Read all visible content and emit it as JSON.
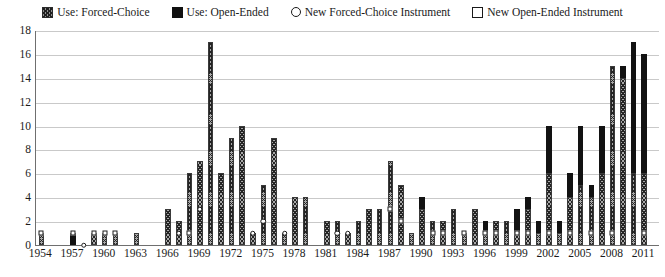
{
  "chart_data": {
    "type": "bar",
    "title": "",
    "subtitle": "",
    "xlabel": "",
    "ylabel": "",
    "ylim": [
      0,
      18
    ],
    "ytick_step": 2,
    "yticks": [
      0,
      2,
      4,
      6,
      8,
      10,
      12,
      14,
      16,
      18
    ],
    "grid": true,
    "stacked": true,
    "legend_position": "top-center",
    "legend": [
      {
        "label": "Use: Forced-Choice",
        "swatch": "hatched-square",
        "color": "#8d8d8d"
      },
      {
        "label": "Use: Open-Ended",
        "swatch": "filled-square",
        "color": "#111111"
      },
      {
        "label": "New Forced-Choice Instrument",
        "swatch": "open-circle",
        "color": "#ffffff"
      },
      {
        "label": "New Open-Ended Instrument",
        "swatch": "open-square",
        "color": "#ffffff"
      }
    ],
    "xtick_labels": [
      "1954",
      "1957",
      "1960",
      "1963",
      "1966",
      "1969",
      "1972",
      "1975",
      "1978",
      "1981",
      "1984",
      "1987",
      "1990",
      "1993",
      "1996",
      "1999",
      "2002",
      "2005",
      "2008",
      "2011"
    ],
    "xtick_interval_years": 3,
    "x_range": [
      1954,
      2012
    ],
    "categories": [
      1954,
      1955,
      1956,
      1957,
      1958,
      1959,
      1960,
      1961,
      1962,
      1963,
      1964,
      1965,
      1966,
      1967,
      1968,
      1969,
      1970,
      1971,
      1972,
      1973,
      1974,
      1975,
      1976,
      1977,
      1978,
      1979,
      1980,
      1981,
      1982,
      1983,
      1984,
      1985,
      1986,
      1987,
      1988,
      1989,
      1990,
      1991,
      1992,
      1993,
      1994,
      1995,
      1996,
      1997,
      1998,
      1999,
      2000,
      2001,
      2002,
      2003,
      2004,
      2005,
      2006,
      2007,
      2008,
      2009,
      2010,
      2011,
      2012
    ],
    "series": [
      {
        "name": "Use: Forced-Choice",
        "values": [
          1,
          0,
          0,
          0,
          0,
          1,
          1,
          1,
          0,
          1,
          0,
          0,
          3,
          2,
          6,
          7,
          17,
          6,
          9,
          10,
          1,
          5,
          9,
          1,
          4,
          4,
          0,
          2,
          2,
          1,
          2,
          3,
          3,
          7,
          5,
          1,
          3,
          2,
          2,
          3,
          1,
          3,
          1,
          2,
          2,
          1,
          3,
          1,
          6,
          1,
          4,
          5,
          4,
          6,
          15,
          14,
          6,
          6,
          0
        ]
      },
      {
        "name": "Use: Open-Ended",
        "values": [
          0,
          0,
          0,
          1,
          0,
          0,
          0,
          0,
          0,
          0,
          0,
          0,
          0,
          0,
          0,
          0,
          0,
          0,
          0,
          0,
          0,
          0,
          0,
          0,
          0,
          0,
          0,
          0,
          0,
          0,
          0,
          0,
          0,
          0,
          0,
          0,
          1,
          0,
          0,
          0,
          0,
          0,
          1,
          0,
          0,
          2,
          1,
          1,
          4,
          1,
          2,
          5,
          1,
          4,
          0,
          1,
          11,
          10,
          0
        ]
      }
    ],
    "markers": [
      {
        "year": 1954,
        "type": "New Open-Ended Instrument",
        "shape": "square",
        "value": 1
      },
      {
        "year": 1957,
        "type": "New Open-Ended Instrument",
        "shape": "square",
        "value": 1
      },
      {
        "year": 1958,
        "type": "New Forced-Choice Instrument",
        "shape": "circle",
        "value": 0
      },
      {
        "year": 1959,
        "type": "New Open-Ended Instrument",
        "shape": "square",
        "value": 1
      },
      {
        "year": 1960,
        "type": "New Open-Ended Instrument",
        "shape": "square",
        "value": 1
      },
      {
        "year": 1961,
        "type": "New Open-Ended Instrument",
        "shape": "square",
        "value": 1
      },
      {
        "year": 1967,
        "type": "New Forced-Choice Instrument",
        "shape": "circle",
        "value": 1
      },
      {
        "year": 1968,
        "type": "New Open-Ended Instrument",
        "shape": "square",
        "value": 1
      },
      {
        "year": 1969,
        "type": "New Forced-Choice Instrument",
        "shape": "circle",
        "value": 3
      },
      {
        "year": 1974,
        "type": "New Forced-Choice Instrument",
        "shape": "circle",
        "value": 1
      },
      {
        "year": 1975,
        "type": "New Forced-Choice Instrument",
        "shape": "circle",
        "value": 2
      },
      {
        "year": 1977,
        "type": "New Forced-Choice Instrument",
        "shape": "circle",
        "value": 1
      },
      {
        "year": 1982,
        "type": "New Forced-Choice Instrument",
        "shape": "circle",
        "value": 1
      },
      {
        "year": 1983,
        "type": "New Forced-Choice Instrument",
        "shape": "circle",
        "value": 1
      },
      {
        "year": 1987,
        "type": "New Open-Ended Instrument",
        "shape": "square",
        "value": 3
      },
      {
        "year": 1988,
        "type": "New Open-Ended Instrument",
        "shape": "square",
        "value": 2
      },
      {
        "year": 1991,
        "type": "New Open-Ended Instrument",
        "shape": "square",
        "value": 1
      },
      {
        "year": 1992,
        "type": "New Open-Ended Instrument",
        "shape": "square",
        "value": 1
      },
      {
        "year": 1994,
        "type": "New Open-Ended Instrument",
        "shape": "square",
        "value": 1
      },
      {
        "year": 1996,
        "type": "New Open-Ended Instrument",
        "shape": "square",
        "value": 1
      },
      {
        "year": 1997,
        "type": "New Open-Ended Instrument",
        "shape": "square",
        "value": 1
      },
      {
        "year": 1999,
        "type": "New Open-Ended Instrument",
        "shape": "square",
        "value": 1
      },
      {
        "year": 2000,
        "type": "New Open-Ended Instrument",
        "shape": "square",
        "value": 1
      },
      {
        "year": 2002,
        "type": "New Open-Ended Instrument",
        "shape": "square",
        "value": 1
      },
      {
        "year": 2004,
        "type": "New Open-Ended Instrument",
        "shape": "square",
        "value": 1
      },
      {
        "year": 2006,
        "type": "New Open-Ended Instrument",
        "shape": "square",
        "value": 1
      },
      {
        "year": 2008,
        "type": "New Open-Ended Instrument",
        "shape": "square",
        "value": 1
      },
      {
        "year": 2011,
        "type": "New Open-Ended Instrument",
        "shape": "square",
        "value": 1
      }
    ]
  }
}
